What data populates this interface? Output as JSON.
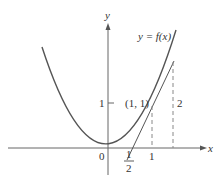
{
  "figure": {
    "curve_label": "y = f(x)",
    "axis_x_label": "x",
    "axis_y_label": "y",
    "origin_label": "0",
    "y_tick_label": "1",
    "x_tick_label_1": "1",
    "x_tick_half_num": "1",
    "x_tick_half_den": "2",
    "point_label": "(1, 1)",
    "rise_label": "2",
    "colors": {
      "curve": "#555555",
      "axis": "#666666",
      "tangent": "#555555",
      "dashed": "#888888",
      "text": "#333333"
    }
  }
}
